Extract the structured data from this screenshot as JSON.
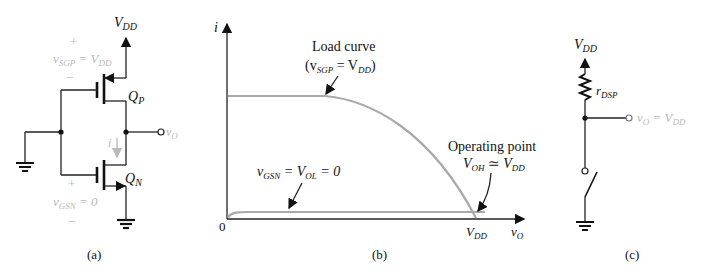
{
  "panel_a": {
    "caption": "(a)",
    "vdd_label": "V",
    "vdd_sub": "DD",
    "pmos_label": "Q",
    "pmos_sub": "P",
    "nmos_label": "Q",
    "nmos_sub": "N",
    "pmos_plus": "+",
    "pmos_minus": "−",
    "pmos_vsg": "v",
    "pmos_vsg_sub": "SGP",
    "pmos_vsg_eq": " = V",
    "pmos_vsg_eq_sub": "DD",
    "nmos_plus": "+",
    "nmos_minus": "−",
    "nmos_vgs": "v",
    "nmos_vgs_sub": "GSN",
    "nmos_vgs_eq": " = 0",
    "current_label": "i",
    "output_label": "v",
    "output_sub": "O"
  },
  "panel_b": {
    "caption": "(b)",
    "y_axis_label": "i",
    "origin_label": "0",
    "x_tick_label": "V",
    "x_tick_sub": "DD",
    "x_axis_label": "v",
    "x_axis_sub": "O",
    "load_curve_title": "Load curve",
    "load_curve_cond_open": "(v",
    "load_curve_cond_sub": "SGP",
    "load_curve_cond_eq": " = V",
    "load_curve_cond_sub2": "DD",
    "load_curve_cond_close": ")",
    "nmos_curve_label": "v",
    "nmos_curve_sub": "GSN",
    "nmos_curve_eq": " = V",
    "nmos_curve_sub2": "OL",
    "nmos_curve_eq2": " = 0",
    "op_title": "Operating point",
    "op_v1": "V",
    "op_v1_sub": "OH",
    "op_approx": " ≃ V",
    "op_v2_sub": "DD"
  },
  "panel_c": {
    "caption": "(c)",
    "vdd_label": "V",
    "vdd_sub": "DD",
    "resistor_label": "r",
    "resistor_sub": "DSP",
    "output_label": "v",
    "output_sub": "O",
    "output_eq": " = V",
    "output_sub2": "DD"
  },
  "colors": {
    "ink": "#111111",
    "gray_text": "#b9b9b9",
    "curve": "#a9a9a9"
  }
}
